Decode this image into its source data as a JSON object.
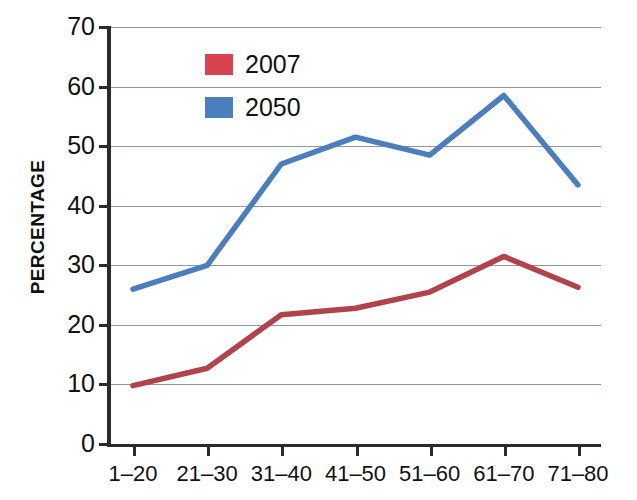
{
  "chart_data": {
    "type": "line",
    "title": "",
    "xlabel": "",
    "ylabel": "PERCENTAGE",
    "categories": [
      "1–20",
      "21–30",
      "31–40",
      "41–50",
      "51–60",
      "61–70",
      "71–80"
    ],
    "ylim": [
      0,
      70
    ],
    "yticks": [
      0,
      10,
      20,
      30,
      40,
      50,
      60,
      70
    ],
    "ytick_labels": [
      "0",
      "10",
      "20",
      "30",
      "40",
      "50",
      "60",
      "70"
    ],
    "grid": true,
    "legend_position": "inside-upper-left",
    "series": [
      {
        "name": "2007",
        "color": "#b1434a",
        "legend_swatch_color": "#d9434f",
        "values": [
          9.8,
          12.7,
          21.7,
          22.8,
          25.5,
          31.5,
          26.3
        ]
      },
      {
        "name": "2050",
        "color": "#4a7ebc",
        "legend_swatch_color": "#4a7ebc",
        "values": [
          26.0,
          30.0,
          47.0,
          51.5,
          48.5,
          58.5,
          43.5
        ]
      }
    ]
  },
  "legend": {
    "entries": [
      {
        "label": "2007"
      },
      {
        "label": "2050"
      }
    ]
  }
}
